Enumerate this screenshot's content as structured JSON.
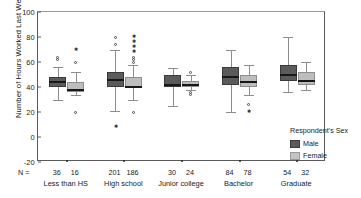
{
  "chart_data": {
    "type": "box",
    "title": "",
    "xlabel": "",
    "ylabel": "Number of Hours Worked Last Week",
    "ylim": [
      -20,
      100
    ],
    "yticks": [
      100,
      80,
      60,
      40,
      20,
      0,
      -20
    ],
    "grid": false,
    "legend": {
      "title": "Respondent's Sex",
      "position": "right",
      "entries": [
        {
          "name": "Male",
          "color": "#5b5b5b"
        },
        {
          "name": "Female",
          "color": "#c4c4c4"
        }
      ]
    },
    "n_prefix": "N =",
    "categories": [
      "Less than HS",
      "High school",
      "Junior college",
      "Bachelor",
      "Graduate"
    ],
    "series": [
      {
        "name": "Male",
        "color": "#5b5b5b",
        "n": [
          36,
          201,
          30,
          84,
          54
        ],
        "boxes": [
          {
            "category": "Less than HS",
            "whisker_low": 30,
            "q1": 40,
            "median": 44,
            "q3": 48,
            "whisker_high": 56,
            "outliers": [
              62,
              64
            ],
            "extremes": []
          },
          {
            "category": "High school",
            "whisker_low": 21,
            "q1": 40,
            "median": 46,
            "q3": 52,
            "whisker_high": 70,
            "outliers": [
              74,
              80
            ],
            "extremes": [
              8
            ]
          },
          {
            "category": "Junior college",
            "whisker_low": 25,
            "q1": 40,
            "median": 42,
            "q3": 50,
            "whisker_high": 55,
            "outliers": [],
            "extremes": []
          },
          {
            "category": "Bachelor",
            "whisker_low": 20,
            "q1": 42,
            "median": 48,
            "q3": 56,
            "whisker_high": 70,
            "outliers": [],
            "extremes": []
          },
          {
            "category": "Graduate",
            "whisker_low": 36,
            "q1": 45,
            "median": 50,
            "q3": 58,
            "whisker_high": 80,
            "outliers": [],
            "extremes": []
          }
        ]
      },
      {
        "name": "Female",
        "color": "#c4c4c4",
        "n": [
          16,
          186,
          24,
          78,
          32
        ],
        "boxes": [
          {
            "category": "Less than HS",
            "whisker_low": 34,
            "q1": 36,
            "median": 38,
            "q3": 44,
            "whisker_high": 52,
            "outliers": [
              20,
              60
            ],
            "extremes": [
              70
            ]
          },
          {
            "category": "High school",
            "whisker_low": 30,
            "q1": 39,
            "median": 40,
            "q3": 48,
            "whisker_high": 58,
            "outliers": [
              60,
              62,
              64,
              20
            ],
            "extremes": [
              68,
              72,
              76,
              80
            ]
          },
          {
            "category": "Junior college",
            "whisker_low": 38,
            "q1": 40,
            "median": 42,
            "q3": 45,
            "whisker_high": 50,
            "outliers": [
              52,
              36,
              34
            ],
            "extremes": []
          },
          {
            "category": "Bachelor",
            "whisker_low": 34,
            "q1": 40,
            "median": 44,
            "q3": 50,
            "whisker_high": 58,
            "outliers": [
              26
            ],
            "extremes": [
              20
            ]
          },
          {
            "category": "Graduate",
            "whisker_low": 38,
            "q1": 42,
            "median": 45,
            "q3": 52,
            "whisker_high": 60,
            "outliers": [],
            "extremes": []
          }
        ]
      }
    ]
  }
}
